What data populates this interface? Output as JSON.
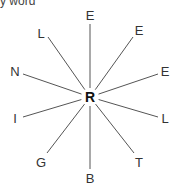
{
  "top_fragment": "y word",
  "center": {
    "letter": "R",
    "x": 90,
    "y": 97
  },
  "spokes": [
    {
      "letter": "E",
      "lx": 90,
      "ly": 15,
      "ex": 90,
      "ey": 24
    },
    {
      "letter": "E",
      "lx": 139,
      "ly": 30,
      "ex": 133,
      "ey": 37
    },
    {
      "letter": "E",
      "lx": 165,
      "ly": 71,
      "ex": 158,
      "ey": 74
    },
    {
      "letter": "L",
      "lx": 165,
      "ly": 118,
      "ex": 158,
      "ey": 117
    },
    {
      "letter": "T",
      "lx": 139,
      "ly": 162,
      "ex": 134,
      "ey": 153
    },
    {
      "letter": "B",
      "lx": 90,
      "ly": 178,
      "ex": 90,
      "ey": 169
    },
    {
      "letter": "G",
      "lx": 41,
      "ly": 162,
      "ex": 47,
      "ey": 153
    },
    {
      "letter": "I",
      "lx": 15,
      "ly": 118,
      "ex": 23,
      "ey": 117
    },
    {
      "letter": "N",
      "lx": 15,
      "ly": 71,
      "ex": 23,
      "ey": 74
    },
    {
      "letter": "L",
      "lx": 41,
      "ly": 33,
      "ex": 48,
      "ey": 37
    }
  ],
  "colors": {
    "line": "#555555",
    "text": "#333333"
  }
}
